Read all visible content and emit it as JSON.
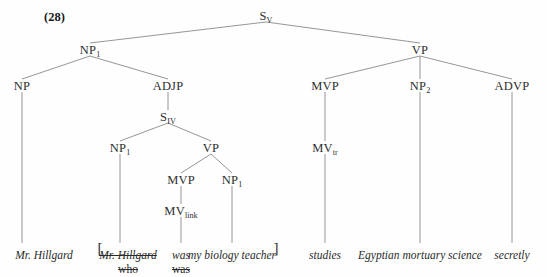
{
  "example": {
    "number": "(28)"
  },
  "tree": {
    "nodes": [
      {
        "id": "S_V",
        "label": "S",
        "sub": "V",
        "x": 266,
        "y": 18
      },
      {
        "id": "NP_1_top",
        "label": "NP",
        "sub": "1",
        "x": 90,
        "y": 52
      },
      {
        "id": "VP_right",
        "label": "VP",
        "sub": "",
        "x": 420,
        "y": 52
      },
      {
        "id": "NP_left",
        "label": "NP",
        "sub": "",
        "x": 22,
        "y": 88
      },
      {
        "id": "ADJP",
        "label": "ADJP",
        "sub": "",
        "x": 168,
        "y": 88
      },
      {
        "id": "S_IV",
        "label": "S",
        "sub": "IV",
        "x": 168,
        "y": 119
      },
      {
        "id": "NP_1_mid",
        "label": "NP",
        "sub": "1",
        "x": 120,
        "y": 150
      },
      {
        "id": "VP_mid",
        "label": "VP",
        "sub": "",
        "x": 211,
        "y": 150
      },
      {
        "id": "MVP_mid",
        "label": "MVP",
        "sub": "",
        "x": 181,
        "y": 182
      },
      {
        "id": "NP_1_obj",
        "label": "NP",
        "sub": "1",
        "x": 232,
        "y": 182
      },
      {
        "id": "MV_link",
        "label": "MV",
        "sub": "link",
        "x": 181,
        "y": 213
      },
      {
        "id": "MVP_r",
        "label": "MVP",
        "sub": "",
        "x": 325,
        "y": 88
      },
      {
        "id": "NP_2",
        "label": "NP",
        "sub": "2",
        "x": 420,
        "y": 88
      },
      {
        "id": "ADVP",
        "label": "ADVP",
        "sub": "",
        "x": 512,
        "y": 88
      },
      {
        "id": "MV_tr",
        "label": "MV",
        "sub": "tr",
        "x": 325,
        "y": 150
      }
    ],
    "edges": [
      {
        "from": "S_V",
        "to": "NP_1_top"
      },
      {
        "from": "S_V",
        "to": "VP_right"
      },
      {
        "from": "NP_1_top",
        "to": "NP_left"
      },
      {
        "from": "NP_1_top",
        "to": "ADJP"
      },
      {
        "from": "ADJP",
        "to": "S_IV"
      },
      {
        "from": "S_IV",
        "to": "NP_1_mid"
      },
      {
        "from": "S_IV",
        "to": "VP_mid"
      },
      {
        "from": "VP_mid",
        "to": "MVP_mid"
      },
      {
        "from": "VP_mid",
        "to": "NP_1_obj"
      },
      {
        "from": "MVP_mid",
        "to": "MV_link"
      },
      {
        "from": "VP_right",
        "to": "MVP_r"
      },
      {
        "from": "VP_right",
        "to": "NP_2"
      },
      {
        "from": "VP_right",
        "to": "ADVP"
      },
      {
        "from": "MVP_r",
        "to": "MV_tr"
      }
    ],
    "leaf_stems": [
      {
        "name": "stem-np-left",
        "x": 22,
        "y1": 92,
        "y2": 243
      },
      {
        "name": "stem-np1-mid",
        "x": 120,
        "y1": 154,
        "y2": 243
      },
      {
        "name": "stem-mv-link",
        "x": 181,
        "y1": 217,
        "y2": 243
      },
      {
        "name": "stem-np1-obj",
        "x": 232,
        "y1": 186,
        "y2": 243
      },
      {
        "name": "stem-mv-tr",
        "x": 325,
        "y1": 154,
        "y2": 243
      },
      {
        "name": "stem-np2",
        "x": 420,
        "y1": 92,
        "y2": 243
      },
      {
        "name": "stem-advp",
        "x": 512,
        "y1": 92,
        "y2": 243
      }
    ]
  },
  "terminals": {
    "row1": [
      {
        "name": "terminal-mr-hillgard-subject",
        "text": "Mr. Hillgard",
        "x": 44,
        "y": 249,
        "struck": false,
        "style": "italic"
      },
      {
        "name": "terminal-mr-hillgard-trace",
        "text": "Mr. Hillgard",
        "x": 128,
        "y": 249,
        "struck": true,
        "style": "italic"
      },
      {
        "name": "terminal-was",
        "text": "was",
        "x": 181,
        "y": 249,
        "struck": false,
        "style": "italic"
      },
      {
        "name": "terminal-my-biology-teacher",
        "text": "my biology teacher",
        "x": 232,
        "y": 249,
        "struck": false,
        "style": "italic"
      },
      {
        "name": "terminal-studies",
        "text": "studies",
        "x": 325,
        "y": 249,
        "struck": false,
        "style": "italic"
      },
      {
        "name": "terminal-egyptian-mortuary",
        "text": "Egyptian mortuary science",
        "x": 420,
        "y": 249,
        "struck": false,
        "style": "italic"
      },
      {
        "name": "terminal-secretly",
        "text": "secretly",
        "x": 512,
        "y": 249,
        "struck": false,
        "style": "italic"
      }
    ],
    "row2": [
      {
        "name": "terminal-who",
        "text": "who",
        "x": 128,
        "y": 263,
        "struck": true,
        "style": "upright"
      },
      {
        "name": "terminal-was-struck",
        "text": "was",
        "x": 181,
        "y": 263,
        "struck": true,
        "style": "upright"
      }
    ],
    "brackets": [
      {
        "name": "bracket-open",
        "text": "[",
        "x": 100,
        "y": 240
      },
      {
        "name": "bracket-close",
        "text": "]",
        "x": 276,
        "y": 240
      }
    ]
  },
  "colors": {
    "line": "#8a8a8a",
    "text": "#2a2a2a",
    "background": "#fefefe"
  }
}
